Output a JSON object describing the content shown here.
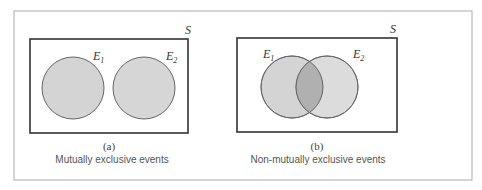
{
  "figure": {
    "universe_label": "S",
    "panels": [
      {
        "id": "a",
        "panel_label": "(a)",
        "caption": "Mutually exclusive events",
        "events": [
          {
            "label": "E",
            "sub": "1"
          },
          {
            "label": "E",
            "sub": "2"
          }
        ]
      },
      {
        "id": "b",
        "panel_label": "(b)",
        "caption": "Non-mutually exclusive events",
        "events": [
          {
            "label": "E",
            "sub": "1"
          },
          {
            "label": "E",
            "sub": "2"
          }
        ]
      }
    ],
    "colors": {
      "circle_fill": "#d4d4d4",
      "overlap_fill": "#b3b3b3",
      "stroke": "#555555",
      "frame": "#aaaaaa"
    }
  }
}
